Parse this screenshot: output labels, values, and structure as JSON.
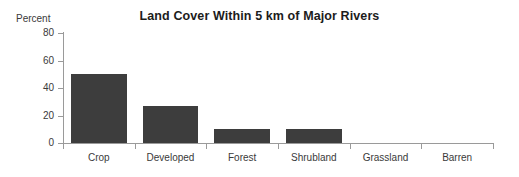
{
  "chart_data": {
    "type": "bar",
    "title": "Land Cover Within 5 km of Major Rivers",
    "xlabel": "",
    "ylabel": "Percent",
    "categories": [
      "Crop",
      "Developed",
      "Forest",
      "Shrubland",
      "Grassland",
      "Barren"
    ],
    "values": [
      50,
      27,
      10,
      10,
      0,
      0
    ],
    "series": [
      {
        "name": "Percent of land cover",
        "values": [
          50,
          27,
          10,
          10,
          0,
          0
        ]
      }
    ],
    "ylim": [
      0,
      80
    ],
    "yticks": [
      0,
      20,
      40,
      60,
      80
    ],
    "ytick_labels": [
      "0",
      "20",
      "40",
      "60",
      "80"
    ],
    "grid": false,
    "legend": "none",
    "bar_color": "#3d3d3d",
    "axis_color": "#9a9a9a",
    "text_color": "#3a3a3a",
    "title_color": "#1c1c1c",
    "background": "#ffffff"
  }
}
